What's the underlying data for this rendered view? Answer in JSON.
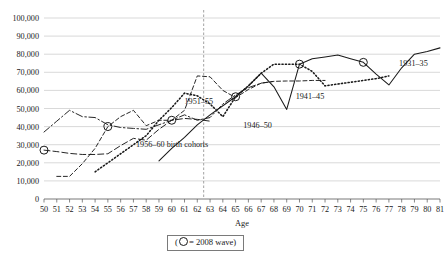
{
  "chart_data": {
    "type": "line",
    "title": "",
    "xlabel": "Age",
    "ylabel": "",
    "xlim": [
      50,
      81
    ],
    "ylim": [
      0,
      100000
    ],
    "grid": true,
    "legend_position": "below-plot",
    "x_ticks": [
      50,
      51,
      52,
      53,
      54,
      55,
      56,
      57,
      58,
      59,
      60,
      61,
      62,
      63,
      64,
      65,
      66,
      67,
      68,
      69,
      70,
      71,
      72,
      73,
      74,
      75,
      76,
      77,
      78,
      79,
      80,
      81
    ],
    "y_ticks": [
      0,
      10000,
      20000,
      30000,
      40000,
      50000,
      60000,
      70000,
      80000,
      90000,
      100000
    ],
    "y_tick_labels": [
      "0",
      "10,000",
      "20,000",
      "30,000",
      "40,000",
      "50,000",
      "60,000",
      "70,000",
      "80,000",
      "90,000",
      "100,000"
    ],
    "reference_line": {
      "axis": "x",
      "value": 62.5,
      "style": "dashed"
    },
    "marker_note": "2008 wave",
    "series": [
      {
        "name": "1956-60",
        "label": "1956–60 birth cohorts",
        "label_x": 57.2,
        "label_y": 28500,
        "style": "long-dash",
        "dasharray": "6,3",
        "width": 0.95,
        "x": [
          50,
          51,
          52,
          53,
          54,
          55,
          56,
          57,
          58,
          59,
          60,
          61,
          62,
          63
        ],
        "values": [
          27000,
          26200,
          25200,
          24600,
          24600,
          25000,
          29500,
          33500,
          32500,
          38500,
          43500,
          44500,
          44000,
          43000
        ]
      },
      {
        "name": "1951-55",
        "label": "1951–55",
        "label_x": 61.0,
        "label_y": 52500,
        "style": "dash-dot",
        "dasharray": "7,2.5,1.6,2.5",
        "width": 0.95,
        "x": [
          50,
          51,
          52,
          53,
          54,
          55,
          56,
          57,
          58,
          59,
          60,
          61,
          62,
          63,
          64,
          65,
          66,
          67,
          68
        ],
        "values": [
          37000,
          43000,
          49000,
          45500,
          45000,
          41000,
          39500,
          39000,
          38500,
          41000,
          43500,
          46500,
          43500,
          45000,
          52500,
          57500,
          61500,
          64000,
          65000
        ]
      },
      {
        "name": "1946-50",
        "label": "1946–50",
        "label_x": 65.6,
        "label_y": 39000,
        "style": "short-dash",
        "dasharray": "4,2.6",
        "width": 0.95,
        "x": [
          51,
          52,
          53,
          54,
          55,
          56,
          57,
          58,
          59,
          60,
          61,
          62,
          63,
          64,
          65,
          66,
          67,
          68,
          69,
          70,
          71,
          72
        ],
        "values": [
          12500,
          12500,
          19500,
          28000,
          40000,
          45500,
          49000,
          40500,
          43500,
          43500,
          49000,
          68000,
          67500,
          60000,
          56000,
          60500,
          64000,
          65000,
          65200,
          65200,
          65500,
          65500
        ]
      },
      {
        "name": "1941-45",
        "label": "1941–45",
        "label_x": 69.7,
        "label_y": 55500,
        "style": "dotted",
        "dasharray": "1.2,2.2",
        "width": 1.55,
        "x": [
          54,
          55,
          56,
          57,
          58,
          59,
          60,
          61,
          62,
          63,
          64,
          65,
          66,
          67,
          68,
          69,
          70,
          71,
          72,
          73,
          74,
          75,
          76,
          77
        ],
        "values": [
          15000,
          20000,
          25000,
          30000,
          35000,
          43500,
          50500,
          58500,
          57000,
          52500,
          45500,
          56500,
          62500,
          69500,
          74500,
          74500,
          74500,
          70500,
          62500,
          63500,
          64500,
          65500,
          66500,
          68000
        ]
      },
      {
        "name": "1931-35",
        "label": "1931–35",
        "label_x": 77.8,
        "label_y": 73500,
        "style": "solid",
        "dasharray": "none",
        "width": 1.05,
        "x": [
          59,
          60,
          61,
          62,
          63,
          64,
          65,
          66,
          67,
          68,
          69,
          70,
          71,
          72,
          73,
          74,
          75,
          76,
          77,
          78,
          79,
          80,
          81
        ],
        "values": [
          21000,
          28000,
          34000,
          41000,
          46500,
          51500,
          56500,
          62500,
          69500,
          62000,
          49500,
          74500,
          77500,
          78500,
          79500,
          77500,
          75500,
          69000,
          63000,
          72500,
          80000,
          81500,
          83500
        ]
      }
    ],
    "wave_markers": [
      {
        "x": 50,
        "y": 27000
      },
      {
        "x": 55,
        "y": 40000
      },
      {
        "x": 60,
        "y": 43500
      },
      {
        "x": 65,
        "y": 56500
      },
      {
        "x": 70,
        "y": 74500
      },
      {
        "x": 75,
        "y": 75500
      }
    ]
  },
  "legend": {
    "prefix": "(",
    "equals": "= ",
    "text": "2008 wave",
    "suffix": ")"
  },
  "axis": {
    "x_title": "Age"
  }
}
